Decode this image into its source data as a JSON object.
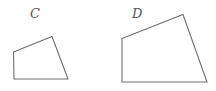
{
  "figure": {
    "shapes": [
      {
        "id": "C",
        "label": "C",
        "kind": "quadrilateral"
      },
      {
        "id": "D",
        "label": "D",
        "kind": "quadrilateral"
      }
    ],
    "colors": {
      "stroke": "#6e6e6e",
      "label": "#555555",
      "background": "#ffffff"
    }
  }
}
